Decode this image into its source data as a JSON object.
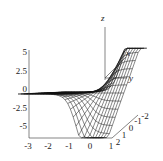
{
  "chart_data": {
    "type": "surface3d",
    "title": "",
    "render_style": "wireframe mesh, black lines on white",
    "axes": {
      "x": {
        "label": "x",
        "ticks": [
          "-3",
          "-2",
          "-1",
          "0",
          "1"
        ],
        "range": [
          -3,
          1
        ]
      },
      "y": {
        "label": "y",
        "ticks": [
          "2",
          "1",
          "0",
          "-1",
          "-2"
        ],
        "range": [
          -2,
          2
        ]
      },
      "z": {
        "label": "z",
        "ticks": [
          "5",
          "2.5",
          "0",
          "-2.5",
          "-5"
        ],
        "range": [
          -6,
          6
        ]
      }
    },
    "axis_line_labels": [
      "z",
      "x",
      "y"
    ],
    "grid": false,
    "legend": null,
    "line_color": "#111111",
    "background_color": "#ffffff"
  }
}
